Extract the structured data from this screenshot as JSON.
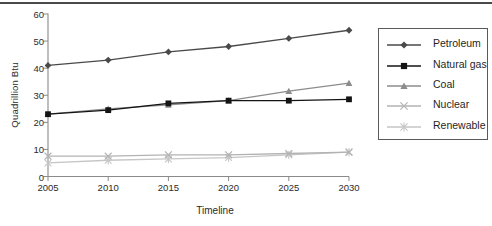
{
  "page": {
    "background": "#ffffff",
    "top_divider_color": "#4a4a4a"
  },
  "chart_data": {
    "type": "line",
    "title": "",
    "xlabel": "Timeline",
    "ylabel": "Quadrillion Btu",
    "x": [
      2005,
      2010,
      2015,
      2020,
      2025,
      2030
    ],
    "x_tick_labels": [
      "2005",
      "2010",
      "2015",
      "2020",
      "2025",
      "2030"
    ],
    "y_ticks": [
      0,
      10,
      20,
      30,
      40,
      50,
      60
    ],
    "y_tick_labels": [
      "0",
      "10",
      "20",
      "30",
      "40",
      "50",
      "60"
    ],
    "ylim": [
      0,
      60
    ],
    "grid": false,
    "legend_position": "right",
    "axis_color": "#8a8a8a",
    "series": [
      {
        "name": "Petroleum",
        "marker": "diamond",
        "color": "#4a4a4a",
        "values": [
          41,
          43,
          46,
          48,
          51,
          54
        ]
      },
      {
        "name": "Natural gas",
        "marker": "square",
        "color": "#141414",
        "values": [
          23,
          24.5,
          27,
          28,
          28,
          28.5
        ]
      },
      {
        "name": "Coal",
        "marker": "triangle",
        "color": "#8c8c8c",
        "values": [
          23,
          25,
          26.5,
          28,
          31.5,
          34.5
        ]
      },
      {
        "name": "Nuclear",
        "marker": "x",
        "color": "#b3b3b3",
        "values": [
          7.5,
          7.5,
          8,
          8,
          8.5,
          9
        ]
      },
      {
        "name": "Renewable",
        "marker": "asterisk",
        "color": "#c6c6c6",
        "values": [
          5,
          6,
          6.5,
          7,
          8,
          9
        ]
      }
    ]
  }
}
